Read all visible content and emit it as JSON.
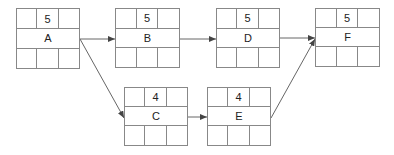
{
  "diagram": {
    "type": "activity-on-node network",
    "nodes": [
      {
        "id": "A",
        "label": "A",
        "duration": "5"
      },
      {
        "id": "B",
        "label": "B",
        "duration": "5"
      },
      {
        "id": "D",
        "label": "D",
        "duration": "5"
      },
      {
        "id": "F",
        "label": "F",
        "duration": "5"
      },
      {
        "id": "C",
        "label": "C",
        "duration": "4"
      },
      {
        "id": "E",
        "label": "E",
        "duration": "4"
      }
    ],
    "edges": [
      {
        "from": "A",
        "to": "B"
      },
      {
        "from": "A",
        "to": "C"
      },
      {
        "from": "B",
        "to": "D"
      },
      {
        "from": "C",
        "to": "E"
      },
      {
        "from": "D",
        "to": "F"
      },
      {
        "from": "E",
        "to": "F"
      }
    ]
  },
  "colors": {
    "line": "#888888",
    "arrow": "#444444",
    "text": "#222222"
  }
}
